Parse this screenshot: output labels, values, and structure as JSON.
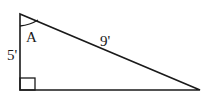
{
  "diagram": {
    "type": "right-triangle",
    "vertices": {
      "top": [
        20,
        14
      ],
      "bottom_left": [
        20,
        90
      ],
      "bottom_right": [
        200,
        90
      ]
    },
    "right_angle_at": "bottom_left",
    "labels": {
      "angle": "A",
      "vertical_side": "5'",
      "hypotenuse": "9'"
    },
    "stroke_color": "#1a1a1a"
  }
}
